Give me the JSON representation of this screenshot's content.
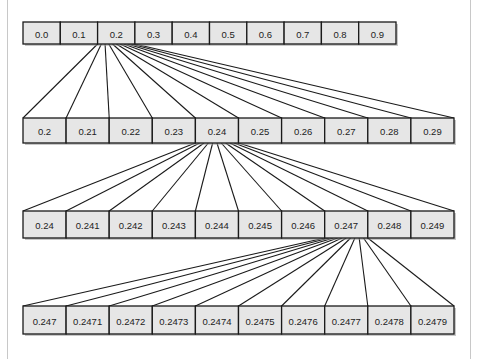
{
  "diagram": {
    "colors": {
      "cell_fill": "#e6e6e6",
      "cell_stroke": "#1a1a1a",
      "line": "#1a1a1a",
      "shadow": "#9a9a9a",
      "frame": "#c8c8c8"
    },
    "rows": [
      {
        "id": "level-1",
        "cells": [
          "0.0",
          "0.1",
          "0.2",
          "0.3",
          "0.4",
          "0.5",
          "0.6",
          "0.7",
          "0.8",
          "0.9"
        ],
        "expanded_index": 2
      },
      {
        "id": "level-2",
        "cells": [
          "0.2",
          "0.21",
          "0.22",
          "0.23",
          "0.24",
          "0.25",
          "0.26",
          "0.27",
          "0.28",
          "0.29"
        ],
        "expanded_index": 4
      },
      {
        "id": "level-3",
        "cells": [
          "0.24",
          "0.241",
          "0.242",
          "0.243",
          "0.244",
          "0.245",
          "0.246",
          "0.247",
          "0.248",
          "0.249"
        ],
        "expanded_index": 7
      },
      {
        "id": "level-4",
        "cells": [
          "0.247",
          "0.2471",
          "0.2472",
          "0.2473",
          "0.2474",
          "0.2475",
          "0.2476",
          "0.2477",
          "0.2478",
          "0.2479"
        ],
        "expanded_index": null
      }
    ]
  }
}
